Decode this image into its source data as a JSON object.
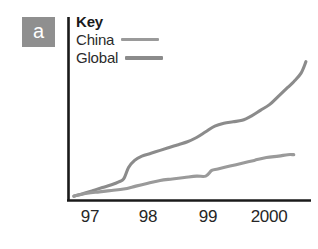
{
  "figure": {
    "panel_label": "a",
    "panel_label_bg": "#8f8f8f"
  },
  "legend": {
    "title": "Key",
    "entries": [
      {
        "label": "China",
        "color": "#9a9a9a"
      },
      {
        "label": "Global",
        "color": "#8b8b8b"
      }
    ]
  },
  "axis": {
    "color": "#1a1a1a",
    "x_tick_labels": [
      "97",
      "98",
      "99",
      "2000"
    ]
  },
  "chart_data": {
    "type": "line",
    "title": "",
    "xlabel": "",
    "ylabel": "",
    "grid": false,
    "legend_position": "top-left",
    "xlim": [
      1996.6,
      2000.6
    ],
    "ylim": [
      0,
      100
    ],
    "x_tick_values": [
      1997,
      1998,
      1999,
      2000
    ],
    "x_tick_labels": [
      "97",
      "98",
      "99",
      "2000"
    ],
    "series": [
      {
        "name": "Global",
        "color": "#8b8b8b",
        "x": [
          1996.68,
          1996.85,
          1997.0,
          1997.15,
          1997.3,
          1997.42,
          1997.5,
          1997.58,
          1997.68,
          1997.8,
          1997.95,
          1998.1,
          1998.25,
          1998.4,
          1998.55,
          1998.7,
          1998.85,
          1999.0,
          1999.15,
          1999.3,
          1999.45,
          1999.6,
          1999.75,
          1999.9,
          2000.05,
          2000.2,
          2000.3,
          2000.42,
          2000.5
        ],
        "y": [
          2,
          4,
          6,
          8,
          10,
          12,
          14,
          22,
          27,
          30,
          32,
          34,
          36,
          38,
          40,
          43,
          47,
          51,
          53,
          54,
          55,
          58,
          62,
          66,
          72,
          78,
          82,
          88,
          96
        ]
      },
      {
        "name": "China",
        "color": "#9a9a9a",
        "x": [
          1996.68,
          1996.9,
          1997.1,
          1997.3,
          1997.5,
          1997.7,
          1997.9,
          1998.1,
          1998.3,
          1998.5,
          1998.7,
          1998.85,
          1998.95,
          1999.05,
          1999.25,
          1999.45,
          1999.65,
          1999.85,
          2000.05,
          2000.2,
          2000.3
        ],
        "y": [
          2,
          4,
          5,
          6,
          7,
          9,
          11,
          13,
          14,
          15,
          16,
          16,
          20,
          21,
          23,
          25,
          27,
          29,
          30,
          31,
          31
        ]
      }
    ]
  }
}
